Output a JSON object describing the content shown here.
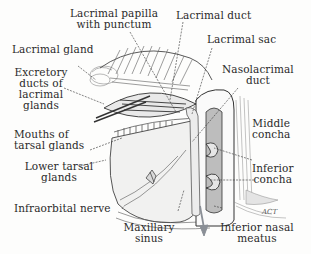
{
  "figure": {
    "signature": "ACT",
    "labels": [
      {
        "id": "lacrimal-papilla",
        "lines": [
          "Lacrimal papilla",
          "with punctum"
        ]
      },
      {
        "id": "lacrimal-duct",
        "lines": [
          "Lacrimal duct"
        ]
      },
      {
        "id": "lacrimal-sac",
        "lines": [
          "Lacrimal sac"
        ]
      },
      {
        "id": "lacrimal-gland",
        "lines": [
          "Lacrimal gland"
        ]
      },
      {
        "id": "excretory-ducts",
        "lines": [
          "Excretory",
          "ducts of",
          "lacrimal",
          "glands"
        ]
      },
      {
        "id": "nasolacrimal-duct",
        "lines": [
          "Nasolacrimal",
          "duct"
        ]
      },
      {
        "id": "middle-concha",
        "lines": [
          "Middle",
          "concha"
        ]
      },
      {
        "id": "mouths-tarsal",
        "lines": [
          "Mouths of",
          "tarsal glands"
        ]
      },
      {
        "id": "lower-tarsal",
        "lines": [
          "Lower tarsal",
          "glands"
        ]
      },
      {
        "id": "inferior-concha",
        "lines": [
          "Inferior",
          "concha"
        ]
      },
      {
        "id": "infraorbital-nerve",
        "lines": [
          "Infraorbital nerve"
        ]
      },
      {
        "id": "maxillary-sinus",
        "lines": [
          "Maxillary",
          "sinus"
        ]
      },
      {
        "id": "inferior-nasal-meatus",
        "lines": [
          "Inferior nasal",
          "meatus"
        ]
      }
    ]
  },
  "colors": {
    "ink": "#2a2a2a",
    "line": "#444444",
    "hatch": "#6b6b6b",
    "arrow": "#8a8f96",
    "background": "#fdfdfc"
  }
}
